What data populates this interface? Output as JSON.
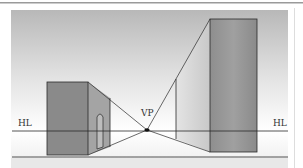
{
  "diagram": {
    "labels": {
      "horizon_left": "HL",
      "horizon_right": "HL",
      "vanishing_point": "VP"
    },
    "colors": {
      "sky_top": "#b9b9b9",
      "sky_bottom": "#ffffff",
      "ground": "#efefef",
      "building_front": "#8a8a8a",
      "building_side": "#a3a3a3",
      "right_side": "#d6d6d6",
      "line": "#2a2a2a"
    },
    "elements": [
      "horizon line",
      "ground line",
      "vanishing point",
      "left building with arched doorway",
      "right tall building",
      "converging perspective lines"
    ]
  }
}
